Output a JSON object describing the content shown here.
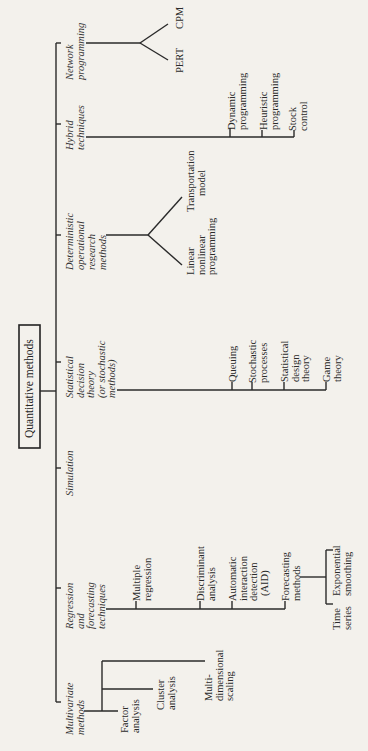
{
  "diagram": {
    "title": "Quantitative methods",
    "orientation": "rotated 90° counterclockwise",
    "categories": [
      {
        "id": "network",
        "label_lines": [
          "Network",
          "programming"
        ],
        "children": [
          {
            "label_lines": [
              "PERT"
            ]
          },
          {
            "label_lines": [
              "CPM"
            ]
          }
        ]
      },
      {
        "id": "hybrid",
        "label_lines": [
          "Hybrid",
          "techniques"
        ],
        "children": [
          {
            "label_lines": [
              "Dynamic",
              "programming"
            ]
          },
          {
            "label_lines": [
              "Heuristic",
              "programming"
            ]
          },
          {
            "label_lines": [
              "Stock",
              "control"
            ]
          }
        ]
      },
      {
        "id": "deterministic",
        "label_lines": [
          "Deterministic",
          "operational",
          "research",
          "methods"
        ],
        "children": [
          {
            "label_lines": [
              "Linear",
              "nonlinear",
              "programming"
            ]
          },
          {
            "label_lines": [
              "Transportation",
              "model"
            ]
          }
        ]
      },
      {
        "id": "statistical",
        "label_lines": [
          "Statistical",
          "decision",
          "theory",
          "(or stochastic",
          "methods)"
        ],
        "children": [
          {
            "label_lines": [
              "Queuing"
            ]
          },
          {
            "label_lines": [
              "Stochastic",
              "processes"
            ]
          },
          {
            "label_lines": [
              "Statistical",
              "design",
              "theory"
            ]
          },
          {
            "label_lines": [
              "Game",
              "theory"
            ]
          }
        ]
      },
      {
        "id": "simulation",
        "label_lines": [
          "Simulation"
        ],
        "children": []
      },
      {
        "id": "regression",
        "label_lines": [
          "Regression",
          "and",
          "forecasting",
          "techniques"
        ],
        "children": [
          {
            "label_lines": [
              "Multiple",
              "regression"
            ]
          },
          {
            "label_lines": [
              "Discriminant",
              "analysis"
            ]
          },
          {
            "label_lines": [
              "Automatic",
              "interaction",
              "detection",
              "(AID)"
            ]
          },
          {
            "label_lines": [
              "Forecasting",
              "methods"
            ],
            "children": [
              {
                "label_lines": [
                  "Time",
                  "series"
                ]
              },
              {
                "label_lines": [
                  "Exponential",
                  "smoothing"
                ]
              }
            ]
          }
        ]
      },
      {
        "id": "multivariate",
        "label_lines": [
          "Multivariate",
          "methods"
        ],
        "children": [
          {
            "label_lines": [
              "Factor",
              "analysis"
            ]
          },
          {
            "label_lines": [
              "Cluster",
              "analysis"
            ]
          },
          {
            "label_lines": [
              "Multi-",
              "dimensional",
              "scaling"
            ]
          }
        ]
      }
    ]
  }
}
